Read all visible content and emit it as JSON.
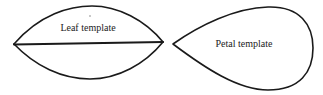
{
  "diagram": {
    "leaf": {
      "label": "Leaf template",
      "shape": "lens with central midrib line"
    },
    "petal": {
      "label": "Petal template",
      "shape": "teardrop pointing left"
    },
    "colors": {
      "stroke": "#1a1a1a",
      "text": "#222222",
      "background": "#ffffff"
    }
  }
}
